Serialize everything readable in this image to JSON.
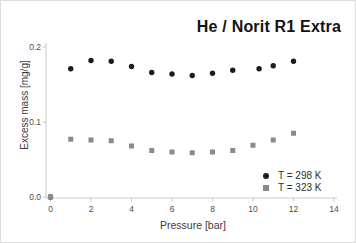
{
  "figure": {
    "background": "#ffffff",
    "border_color": "#dcdcdc"
  },
  "chart_data": {
    "type": "scatter",
    "title": "He / Norit R1 Extra",
    "xlabel": "Pressure [bar]",
    "ylabel": "Excess mass [mg/g]",
    "xlim": [
      0,
      14
    ],
    "ylim": [
      0,
      0.21
    ],
    "x_ticks": [
      0,
      2,
      4,
      6,
      8,
      10,
      12,
      14
    ],
    "y_tick_labels": [
      "0.0",
      "0.1",
      "0.2"
    ],
    "grid": false,
    "legend_position": "lower-right",
    "axis_color": "#c9c9c9",
    "tick_label_color": "#4d4d4d",
    "series": [
      {
        "name": "T = 298 K",
        "marker": "circle",
        "color": "#1c1c1c",
        "points": [
          [
            0,
            0.0
          ],
          [
            1,
            0.171
          ],
          [
            2,
            0.182
          ],
          [
            3,
            0.181
          ],
          [
            4,
            0.174
          ],
          [
            5,
            0.166
          ],
          [
            6,
            0.164
          ],
          [
            7,
            0.162
          ],
          [
            8,
            0.165
          ],
          [
            9,
            0.169
          ],
          [
            10.3,
            0.171
          ],
          [
            11,
            0.175
          ],
          [
            12,
            0.181
          ]
        ]
      },
      {
        "name": "T = 323 K",
        "marker": "square",
        "color": "#8a8a8a",
        "points": [
          [
            0,
            0.0
          ],
          [
            1,
            0.077
          ],
          [
            2,
            0.076
          ],
          [
            3,
            0.075
          ],
          [
            4,
            0.068
          ],
          [
            5,
            0.062
          ],
          [
            6,
            0.06
          ],
          [
            7,
            0.059
          ],
          [
            8,
            0.06
          ],
          [
            9,
            0.062
          ],
          [
            10,
            0.069
          ],
          [
            11,
            0.076
          ],
          [
            12,
            0.085
          ]
        ]
      }
    ]
  }
}
